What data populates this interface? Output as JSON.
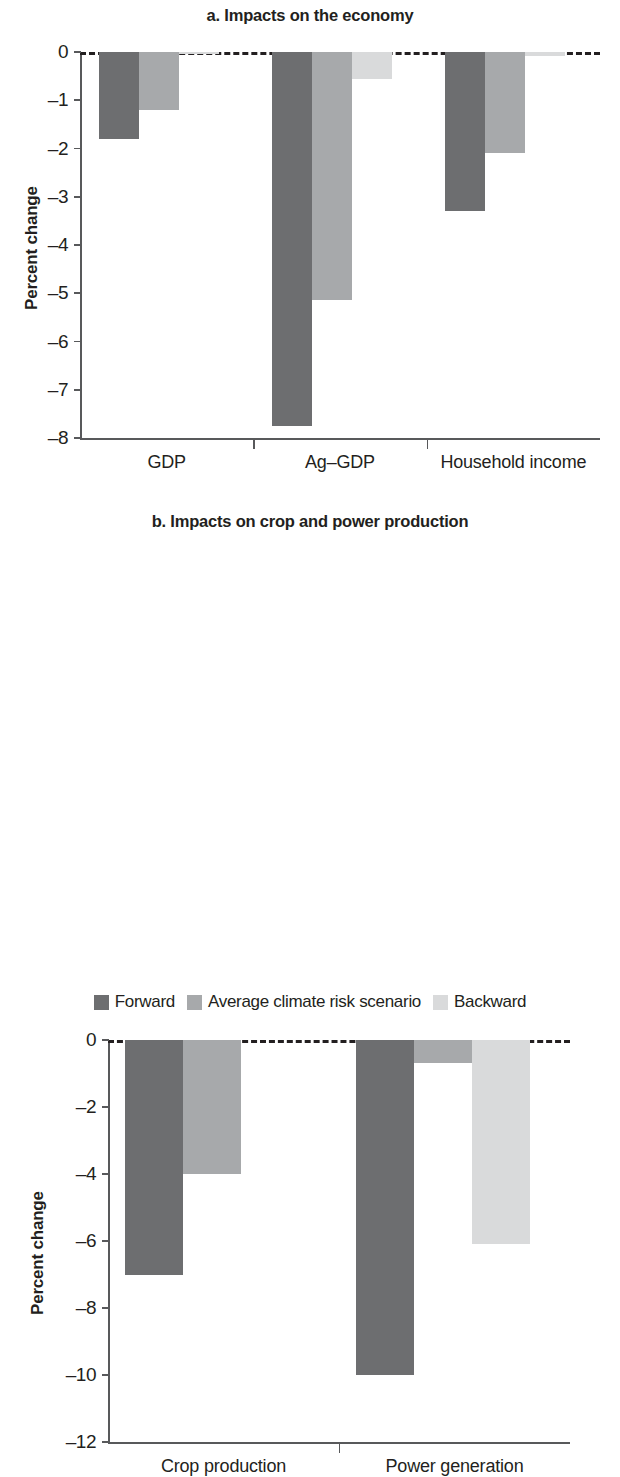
{
  "figure": {
    "y_axis_title": "Percent change",
    "series_colors": {
      "forward": "#6d6e70",
      "average": "#a7a9ab",
      "backward": "#d9dadb"
    }
  },
  "legend": {
    "items": [
      {
        "label": "Forward",
        "color": "#6d6e70",
        "swatch": "forward-swatch"
      },
      {
        "label": "Average climate risk scenario",
        "color": "#a7a9ab",
        "swatch": "average-swatch"
      },
      {
        "label": "Backward",
        "color": "#d9dadb",
        "swatch": "backward-swatch"
      }
    ]
  },
  "chart_data": [
    {
      "type": "bar",
      "panel": "a",
      "title": "a. Impacts on the economy",
      "xlabel": "",
      "ylabel": "Percent change",
      "categories": [
        "GDP",
        "Ag–GDP",
        "Household income"
      ],
      "yticks": [
        0,
        -1,
        -2,
        -3,
        -4,
        -5,
        -6,
        -7,
        -8
      ],
      "ytick_labels": [
        "0",
        "–1",
        "–2",
        "–3",
        "–4",
        "–5",
        "–6",
        "–7",
        "–8"
      ],
      "ylim": [
        -8,
        0
      ],
      "grid": false,
      "zero_reference_line": true,
      "legend_position": "bottom",
      "series": [
        {
          "name": "Forward",
          "values": [
            -1.8,
            -7.75,
            -3.3
          ]
        },
        {
          "name": "Average climate risk scenario",
          "values": [
            -1.2,
            -5.15,
            -2.1
          ]
        },
        {
          "name": "Backward",
          "values": [
            -0.05,
            -0.55,
            -0.08
          ]
        }
      ]
    },
    {
      "type": "bar",
      "panel": "b",
      "title": "b. Impacts on crop and power production",
      "xlabel": "",
      "ylabel": "Percent change",
      "categories": [
        "Crop production",
        "Power generation"
      ],
      "yticks": [
        0,
        -2,
        -4,
        -6,
        -8,
        -10,
        -12
      ],
      "ytick_labels": [
        "0",
        "–2",
        "–4",
        "–6",
        "–8",
        "–10",
        "–12"
      ],
      "ylim": [
        -12,
        0
      ],
      "grid": false,
      "zero_reference_line": true,
      "legend_position": "bottom",
      "series": [
        {
          "name": "Forward",
          "values": [
            -7.0,
            -10.0
          ]
        },
        {
          "name": "Average climate risk scenario",
          "values": [
            -4.0,
            -0.7
          ]
        },
        {
          "name": "Backward",
          "values": [
            0,
            -6.1
          ]
        }
      ]
    }
  ]
}
